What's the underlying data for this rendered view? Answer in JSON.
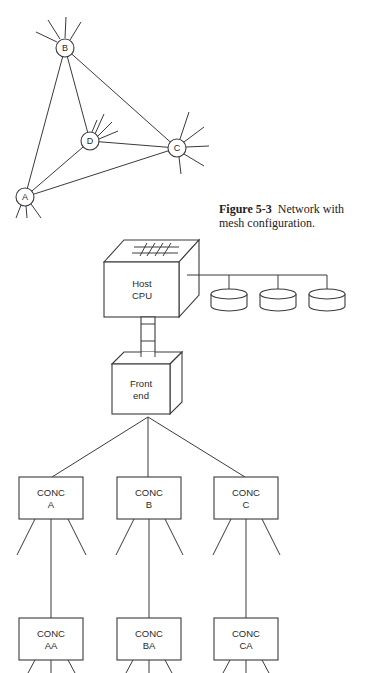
{
  "figure": {
    "number": "Figure 5-3",
    "caption": "Network with mesh configuration."
  },
  "mesh": {
    "nodes": [
      {
        "id": "A",
        "label": "A"
      },
      {
        "id": "B",
        "label": "B"
      },
      {
        "id": "C",
        "label": "C"
      },
      {
        "id": "D",
        "label": "D"
      }
    ],
    "links": [
      [
        "A",
        "B"
      ],
      [
        "A",
        "D"
      ],
      [
        "A",
        "C"
      ],
      [
        "B",
        "D"
      ],
      [
        "B",
        "C"
      ],
      [
        "D",
        "C"
      ]
    ]
  },
  "hierarchy": {
    "host": {
      "line1": "Host",
      "line2": "CPU"
    },
    "frontend": {
      "line1": "Front",
      "line2": "end"
    },
    "disks": [
      "disk-1",
      "disk-2",
      "disk-3"
    ],
    "concentrators_level1": [
      {
        "line1": "CONC",
        "line2": "A"
      },
      {
        "line1": "CONC",
        "line2": "B"
      },
      {
        "line1": "CONC",
        "line2": "C"
      }
    ],
    "concentrators_level2": [
      {
        "line1": "CONC",
        "line2": "AA"
      },
      {
        "line1": "CONC",
        "line2": "BA"
      },
      {
        "line1": "CONC",
        "line2": "CA"
      }
    ]
  }
}
